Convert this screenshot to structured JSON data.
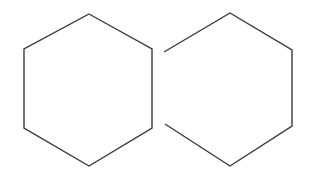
{
  "figure": {
    "background_color": "#ffffff",
    "width": 314,
    "height": 176,
    "shape_count": 2,
    "stroke_color": "#3a3a3a",
    "stroke_width": 1.4,
    "shapes": [
      {
        "name": "left-hexagon",
        "label": "Left hexagon",
        "orientation": "pointy-top",
        "sides_drawn": 6,
        "closed": true,
        "missing_side": "none",
        "center": {
          "x": 88,
          "y": 89
        },
        "vertices": [
          {
            "x": 89,
            "y": 14
          },
          {
            "x": 152,
            "y": 49
          },
          {
            "x": 152,
            "y": 128
          },
          {
            "x": 89,
            "y": 166
          },
          {
            "x": 24,
            "y": 128
          },
          {
            "x": 24,
            "y": 49
          }
        ],
        "points_attr": "89,14 152,49 152,128 89,166 24,128 24,49"
      },
      {
        "name": "right-hexagon",
        "label": "Right hexagon (open left side)",
        "orientation": "pointy-top",
        "sides_drawn": 5,
        "closed": false,
        "missing_side": "left-vertical-edge",
        "center": {
          "x": 228,
          "y": 89
        },
        "vertices": [
          {
            "x": 164,
            "y": 52
          },
          {
            "x": 230,
            "y": 13
          },
          {
            "x": 292,
            "y": 50
          },
          {
            "x": 292,
            "y": 126
          },
          {
            "x": 230,
            "y": 166
          },
          {
            "x": 165,
            "y": 124
          }
        ],
        "points_attr": "164,52 230,13 292,50 292,126 230,166 165,124",
        "gap": {
          "from": {
            "x": 164,
            "y": 52
          },
          "to": {
            "x": 165,
            "y": 124
          },
          "height": 72
        }
      }
    ]
  }
}
